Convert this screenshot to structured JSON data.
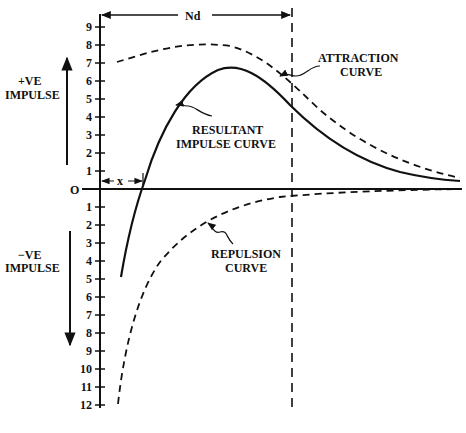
{
  "colors": {
    "ink": "#111111",
    "background": "#ffffff"
  },
  "labels": {
    "positive_impulse": [
      "+VE",
      "IMPULSE"
    ],
    "negative_impulse": [
      "−VE",
      "IMPULSE"
    ],
    "origin": "O",
    "x_marker": "x",
    "nd_marker": "Nd",
    "attraction": [
      "ATTRACTION",
      "CURVE"
    ],
    "resultant": [
      "RESULTANT",
      "IMPULSE CURVE"
    ],
    "repulsion": [
      "REPULSION",
      "CURVE"
    ]
  },
  "axis": {
    "positive_ticks": [
      "1",
      "2",
      "3",
      "4",
      "5",
      "6",
      "7",
      "8",
      "9"
    ],
    "negative_ticks": [
      "1",
      "2",
      "3",
      "4",
      "5",
      "6",
      "7",
      "8",
      "9",
      "10",
      "11",
      "12"
    ]
  },
  "chart_data": {
    "type": "line",
    "title": "",
    "xlabel": "",
    "ylabel": "Impulse (+VE above O, −VE below O)",
    "ylim": [
      -12,
      9
    ],
    "annotations": [
      "Nd (distance to dashed vertical line)",
      "x (distance to zero crossing of resultant curve)"
    ],
    "series": [
      {
        "name": "ATTRACTION CURVE",
        "style": "dashed",
        "x": [
          0.05,
          0.15,
          0.3,
          0.45,
          0.55,
          0.7,
          0.85,
          1.0
        ],
        "y": [
          7.1,
          7.8,
          8.0,
          7.4,
          5.8,
          3.4,
          1.6,
          0.6
        ]
      },
      {
        "name": "RESULTANT IMPULSE CURVE",
        "style": "solid",
        "x": [
          0.05,
          0.11,
          0.2,
          0.32,
          0.45,
          0.55,
          0.7,
          0.85,
          1.0
        ],
        "y": [
          -5.0,
          0.0,
          4.3,
          6.7,
          6.3,
          5.0,
          2.8,
          1.2,
          0.4
        ]
      },
      {
        "name": "REPULSION CURVE",
        "style": "dashed",
        "x": [
          0.05,
          0.12,
          0.2,
          0.3,
          0.45,
          0.55,
          0.7,
          1.0
        ],
        "y": [
          -12.0,
          -6.0,
          -3.0,
          -1.6,
          -0.7,
          -0.4,
          -0.2,
          -0.05
        ]
      }
    ]
  }
}
